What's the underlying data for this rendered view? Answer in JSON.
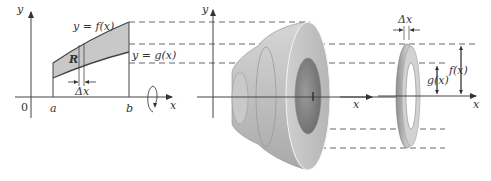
{
  "figure": {
    "colors": {
      "region_fill": "#c8c8c8",
      "solid_fill": "#bdbdbd",
      "axis": "#444444",
      "dash": "#555555"
    }
  },
  "left_panel": {
    "y_axis_label": "y",
    "x_axis_label": "x",
    "origin_label": "0",
    "a_label": "a",
    "b_label": "b",
    "upper_curve_label": "y = f(x)",
    "lower_curve_label": "y = g(x)",
    "region_label": "R",
    "delta_label": "Δx"
  },
  "middle_panel": {
    "y_axis_label": "y",
    "x_axis_label": "x"
  },
  "right_panel": {
    "delta_label": "Δx",
    "outer_radius_label": "f(x)",
    "inner_radius_label": "g(x)",
    "x_axis_label": "x"
  }
}
